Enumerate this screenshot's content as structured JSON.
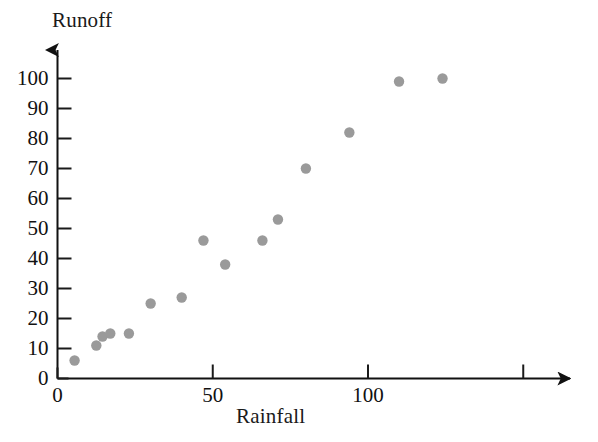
{
  "chart_data": {
    "type": "scatter",
    "title": "",
    "xlabel": "Rainfall",
    "ylabel": "Runoff",
    "xlim": [
      0,
      160
    ],
    "ylim": [
      0,
      110
    ],
    "grid": false,
    "legend": null,
    "marker_color": "#9a9a9a",
    "axis_color": "#1a1a1a",
    "x_ticks": [
      {
        "value": 0,
        "label": "0"
      },
      {
        "value": 50,
        "label": "50"
      },
      {
        "value": 100,
        "label": "100"
      },
      {
        "value": 150,
        "label": ""
      }
    ],
    "y_ticks": [
      {
        "value": 0,
        "label": "0"
      },
      {
        "value": 10,
        "label": "10"
      },
      {
        "value": 20,
        "label": "20"
      },
      {
        "value": 30,
        "label": "30"
      },
      {
        "value": 40,
        "label": "40"
      },
      {
        "value": 50,
        "label": "50"
      },
      {
        "value": 60,
        "label": "60"
      },
      {
        "value": 70,
        "label": "70"
      },
      {
        "value": 80,
        "label": "80"
      },
      {
        "value": 90,
        "label": "90"
      },
      {
        "value": 100,
        "label": "100"
      }
    ],
    "points": [
      {
        "x": 5.5,
        "y": 6
      },
      {
        "x": 12.5,
        "y": 11
      },
      {
        "x": 14.5,
        "y": 14
      },
      {
        "x": 17,
        "y": 15
      },
      {
        "x": 23,
        "y": 15
      },
      {
        "x": 30,
        "y": 25
      },
      {
        "x": 40,
        "y": 27
      },
      {
        "x": 47,
        "y": 46
      },
      {
        "x": 54,
        "y": 38
      },
      {
        "x": 66,
        "y": 46
      },
      {
        "x": 71,
        "y": 53
      },
      {
        "x": 80,
        "y": 70
      },
      {
        "x": 94,
        "y": 82
      },
      {
        "x": 110,
        "y": 99
      },
      {
        "x": 124,
        "y": 100
      }
    ]
  }
}
